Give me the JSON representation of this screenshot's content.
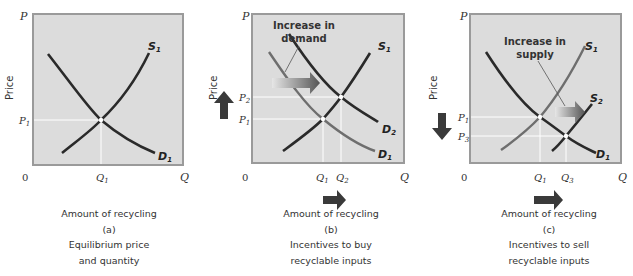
{
  "panels": [
    {
      "id": "a",
      "y_axis_letter": "P",
      "x_axis_letter": "Q",
      "origin": "0",
      "y_label": "Price",
      "price_ticks": [
        {
          "main": "P",
          "sub": "1"
        }
      ],
      "quantity_ticks": [
        {
          "main": "Q",
          "sub": "1"
        }
      ],
      "curves": [
        {
          "main": "S",
          "sub": "1",
          "tone": "dark"
        },
        {
          "main": "D",
          "sub": "1",
          "tone": "dark"
        }
      ],
      "caption": [
        "Amount of recycling",
        "(a)",
        "Equilibrium price",
        "and quantity"
      ]
    },
    {
      "id": "b",
      "y_axis_letter": "P",
      "x_axis_letter": "Q",
      "origin": "0",
      "y_label": "Price",
      "annotation": [
        "Increase in",
        "demand"
      ],
      "price_ticks": [
        {
          "main": "P",
          "sub": "2"
        },
        {
          "main": "P",
          "sub": "1"
        }
      ],
      "quantity_ticks": [
        {
          "main": "Q",
          "sub": "1"
        },
        {
          "main": "Q",
          "sub": "2"
        }
      ],
      "curves": [
        {
          "main": "S",
          "sub": "1",
          "tone": "dark"
        },
        {
          "main": "D",
          "sub": "2",
          "tone": "dark"
        },
        {
          "main": "D",
          "sub": "1",
          "tone": "light"
        }
      ],
      "price_direction": "up",
      "quantity_direction": "right",
      "caption": [
        "Amount of recycling",
        "(b)",
        "Incentives to buy",
        "recyclable inputs"
      ]
    },
    {
      "id": "c",
      "y_axis_letter": "P",
      "x_axis_letter": "Q",
      "origin": "0",
      "y_label": "Price",
      "annotation": [
        "Increase in",
        "supply"
      ],
      "price_ticks": [
        {
          "main": "P",
          "sub": "1"
        },
        {
          "main": "P",
          "sub": "3"
        }
      ],
      "quantity_ticks": [
        {
          "main": "Q",
          "sub": "1"
        },
        {
          "main": "Q",
          "sub": "3"
        }
      ],
      "curves": [
        {
          "main": "S",
          "sub": "1",
          "tone": "light"
        },
        {
          "main": "S",
          "sub": "2",
          "tone": "dark"
        },
        {
          "main": "D",
          "sub": "1",
          "tone": "dark"
        }
      ],
      "price_direction": "down",
      "quantity_direction": "right",
      "caption": [
        "Amount of recycling",
        "(c)",
        "Incentives to sell",
        "recyclable inputs"
      ]
    }
  ],
  "colors": {
    "plot_bg": "#dcdcdc",
    "plot_border": "#9a9a9a",
    "curve_dark": "#2a2a2a",
    "curve_light": "#6e6e6e",
    "guide_line": "#ffffff",
    "arrow": "#3a3a3a"
  }
}
